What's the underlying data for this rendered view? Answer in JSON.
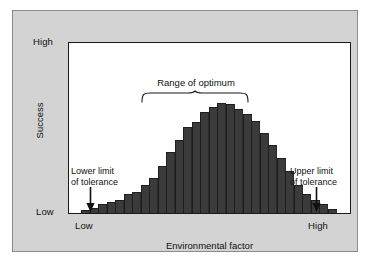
{
  "figure": {
    "background_color": "#ffffff",
    "panel_color": "#d3d3d3",
    "plot_background": "#ffffff",
    "bar_color": "#3b3b3b",
    "axis_color": "#1a1a1a"
  },
  "axes": {
    "y_title": "Success",
    "y_ticks": {
      "high": "High",
      "low": "Low"
    },
    "x_title": "Environmental factor",
    "x_ticks": {
      "low": "Low",
      "high": "High"
    }
  },
  "annotations": {
    "optimum": "Range of optimum",
    "lower_limit_line1": "Lower limit",
    "lower_limit_line2": "of tolerance",
    "upper_limit_line1": "Upper limit",
    "upper_limit_line2": "of tolerance"
  },
  "chart_data": {
    "type": "bar",
    "title": "",
    "xlabel": "Environmental factor",
    "ylabel": "Success",
    "xlim": [
      "Low",
      "High"
    ],
    "ylim": [
      "Low",
      "High"
    ],
    "grid": false,
    "legend": null,
    "annotations": [
      {
        "text": "Range of optimum",
        "type": "brace",
        "x_start": 11,
        "x_end": 20
      },
      {
        "text": "Lower limit of tolerance",
        "type": "arrow",
        "bin": 1
      },
      {
        "text": "Upper limit of tolerance",
        "type": "arrow",
        "bin": 29
      }
    ],
    "categories": [
      "1",
      "2",
      "3",
      "4",
      "5",
      "6",
      "7",
      "8",
      "9",
      "10",
      "11",
      "12",
      "13",
      "14",
      "15",
      "16",
      "17",
      "18",
      "19",
      "20",
      "21",
      "22",
      "23",
      "24",
      "25",
      "26",
      "27",
      "28",
      "29",
      "30"
    ],
    "values": [
      3,
      5,
      8,
      10,
      12,
      17,
      19,
      26,
      32,
      43,
      56,
      67,
      78,
      83,
      92,
      97,
      100,
      99,
      95,
      90,
      84,
      73,
      62,
      50,
      38,
      26,
      17,
      12,
      8,
      4
    ]
  }
}
